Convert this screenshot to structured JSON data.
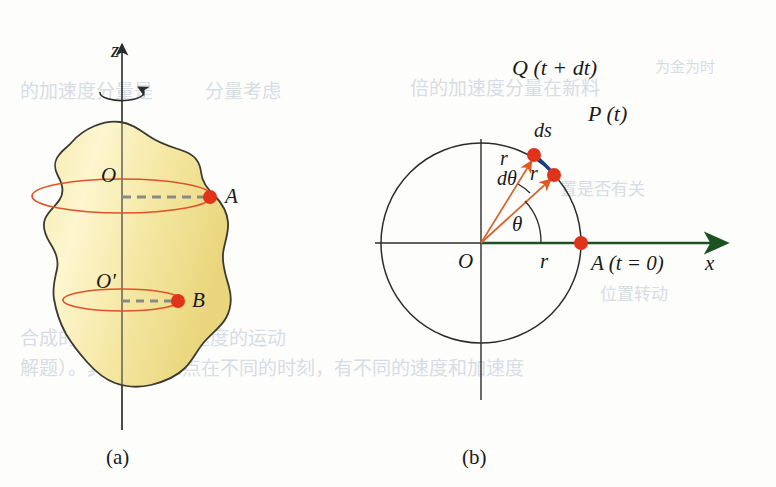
{
  "page": {
    "width": 776,
    "height": 487,
    "background_color": "#fdfdfb"
  },
  "colors": {
    "body_fill_light": "#fdf2c0",
    "body_fill_mid": "#f4e59a",
    "body_fill_dark": "#e8d477",
    "body_outline": "#3a3a33",
    "ellipse_stroke": "#e0522a",
    "dashed_line": "#8a8a82",
    "marker_red": "#e0331a",
    "radius_arrow": "#d4642f",
    "arc_blue": "#1b3f8f",
    "axis_green": "#1c5120",
    "axis_black": "#2b2b2b",
    "text": "#1a1a1a",
    "bleed_text": "#b9c3d2"
  },
  "figure_a": {
    "caption": "(a)",
    "axis_label_z": "z",
    "point_O": "O",
    "point_O_prime": "O'",
    "point_A": "A",
    "point_B": "B",
    "rotation_icon": "rotation-arrow-icon",
    "z_axis": {
      "x": 122,
      "top_y": 38,
      "bottom_y": 430
    },
    "upper_circle": {
      "cx": 122,
      "cy": 196,
      "rx": 90,
      "ry": 17
    },
    "lower_circle": {
      "cx": 122,
      "cy": 300,
      "rx": 59,
      "ry": 11
    },
    "marker_A": {
      "x": 210,
      "y": 197
    },
    "marker_B": {
      "x": 178,
      "y": 301
    }
  },
  "figure_b": {
    "caption": "(b)",
    "center_label": "O",
    "axis_label_x": "x",
    "point_Q_label": "Q (t + dt)",
    "point_P_label": "P (t)",
    "point_A_label": "A (t = 0)",
    "arc_label": "ds",
    "radius_label_1": "r",
    "radius_label_2": "r",
    "radius_label_axis": "r",
    "angle_label_theta": "θ",
    "angle_label_dtheta": "dθ",
    "circle": {
      "cx": 481,
      "cy": 243,
      "r": 100
    },
    "point_P": {
      "x": 554,
      "y": 175
    },
    "point_Q": {
      "x": 534,
      "y": 155
    },
    "point_A": {
      "x": 581,
      "y": 243
    },
    "theta_degrees": 43,
    "dtheta_degrees": 12,
    "x_axis_arrow_end": {
      "x": 728,
      "y": 243
    }
  },
  "bleed_through_text": {
    "note": "faint mirrored text showing through from reverse side of the printed page",
    "lines": [
      {
        "x": 20,
        "y": 98,
        "text": "的加速度分量是"
      },
      {
        "x": 205,
        "y": 98,
        "text": "分量考虑"
      },
      {
        "x": 410,
        "y": 95,
        "text": "倍的加速度分量在新料"
      },
      {
        "x": 655,
        "y": 72,
        "text": "为金为时"
      },
      {
        "x": 20,
        "y": 345,
        "text": "合成的运动是均匀加速度的运动"
      },
      {
        "x": 20,
        "y": 375,
        "text": "解题）。其上的任意点在不同的时刻，有不同的速度和加速度"
      },
      {
        "x": 560,
        "y": 195,
        "text": "置是否有关"
      },
      {
        "x": 600,
        "y": 300,
        "text": "位置转动"
      }
    ]
  }
}
